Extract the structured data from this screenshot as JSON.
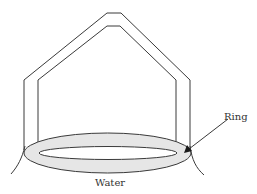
{
  "diagram": {
    "type": "physics-illustration",
    "labels": {
      "ring": "Ring",
      "water": "Water"
    },
    "colors": {
      "stroke": "#3a3a3a",
      "ring_fill": "#e6e6e6",
      "background": "#ffffff"
    },
    "components": [
      {
        "name": "wire-frame",
        "description": "Pentagon-shaped double-line wire frame holding the ring"
      },
      {
        "name": "ring",
        "description": "Shaded elliptical ring resting on water surface"
      },
      {
        "name": "water-surface",
        "description": "Curved meniscus lines on each side of ring"
      },
      {
        "name": "ring-arrow",
        "description": "Arrow pointing from the Ring label to the ring"
      }
    ]
  }
}
